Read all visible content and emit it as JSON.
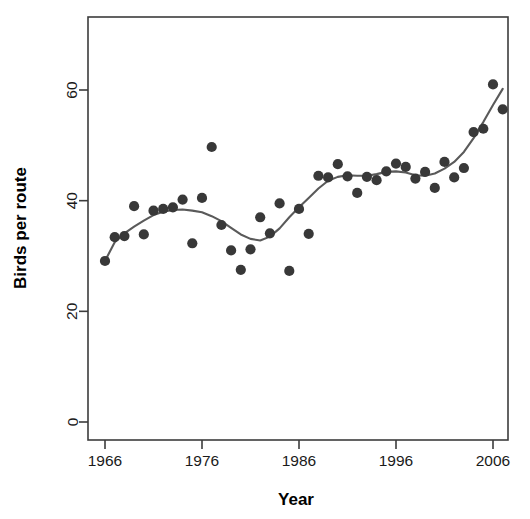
{
  "chart_data": {
    "type": "scatter",
    "title": "",
    "xlabel": "Year",
    "ylabel": "Birds per route",
    "xlim": [
      1965,
      2008
    ],
    "ylim": [
      0,
      68
    ],
    "grid": false,
    "legend": "none",
    "point_color": "#383838",
    "line_color": "#5a5a5a",
    "x_ticks": [
      1966,
      1976,
      1986,
      1996,
      2006
    ],
    "x_tick_labels": [
      "1966",
      "1976",
      "1986",
      "1996",
      "2006"
    ],
    "y_ticks": [
      0,
      20,
      40,
      60
    ],
    "y_tick_labels": [
      "0",
      "20",
      "40",
      "60"
    ],
    "series": [
      {
        "name": "Birds per route",
        "marker": "filled-circle",
        "x": [
          1966,
          1967,
          1968,
          1969,
          1970,
          1971,
          1972,
          1973,
          1974,
          1975,
          1976,
          1977,
          1978,
          1979,
          1980,
          1981,
          1982,
          1983,
          1984,
          1985,
          1986,
          1987,
          1988,
          1989,
          1990,
          1991,
          1992,
          1993,
          1994,
          1995,
          1996,
          1997,
          1998,
          1999,
          2000,
          2001,
          2002,
          2003,
          2004,
          2005,
          2006,
          2007
        ],
        "values": [
          29.1,
          33.4,
          33.6,
          39.0,
          33.9,
          38.2,
          38.5,
          38.8,
          40.2,
          32.3,
          40.5,
          49.7,
          35.6,
          31.0,
          27.5,
          31.2,
          37.0,
          34.1,
          39.5,
          27.3,
          38.5,
          34.0,
          44.5,
          44.2,
          46.6,
          44.4,
          41.4,
          44.3,
          43.7,
          45.3,
          46.7,
          46.1,
          44.0,
          45.2,
          42.3,
          47.0,
          44.2,
          45.9,
          52.4,
          53.0,
          61.0,
          56.5
        ]
      },
      {
        "name": "loess-smoother",
        "marker": "none",
        "x": [
          1966,
          1967,
          1968,
          1969,
          1970,
          1971,
          1972,
          1973,
          1974,
          1975,
          1976,
          1977,
          1978,
          1979,
          1980,
          1981,
          1982,
          1983,
          1984,
          1985,
          1986,
          1987,
          1988,
          1989,
          1990,
          1991,
          1992,
          1993,
          1994,
          1995,
          1996,
          1997,
          1998,
          1999,
          2000,
          2001,
          2002,
          2003,
          2004,
          2005,
          2006,
          2007
        ],
        "values": [
          29.1,
          32.5,
          34.1,
          35.3,
          36.4,
          37.4,
          38.0,
          38.3,
          38.4,
          38.2,
          37.9,
          37.2,
          36.3,
          35.1,
          33.9,
          33.1,
          32.8,
          33.5,
          35.0,
          37.0,
          38.8,
          40.5,
          42.2,
          43.6,
          44.3,
          44.6,
          44.5,
          44.5,
          44.8,
          45.2,
          45.3,
          45.1,
          44.6,
          44.5,
          44.9,
          45.8,
          47.0,
          48.8,
          51.3,
          54.2,
          57.3,
          60.2
        ]
      }
    ]
  },
  "geometry": {
    "plot_left": 88,
    "plot_right": 508,
    "plot_top": 17,
    "plot_bottom": 440,
    "x_origin_px": 105,
    "x_px_per_year": 9.7,
    "y_zero_px": 422,
    "y_px_per_unit": 5.5333
  }
}
